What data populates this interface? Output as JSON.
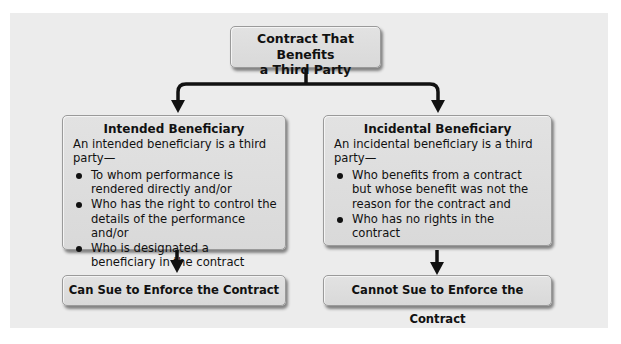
{
  "diagram": {
    "root": {
      "label_line1": "Contract That Benefits",
      "label_line2": "a Third Party"
    },
    "branches": [
      {
        "title": "Intended Beneficiary",
        "intro": "An intended beneficiary is a third party—",
        "bullets": [
          "To whom performance is rendered directly and/or",
          "Who has the right to control the details of the performance and/or",
          "Who is designated a beneficiary in the contract"
        ],
        "outcome": "Can Sue to Enforce the Contract"
      },
      {
        "title": "Incidental Beneficiary",
        "intro": "An incidental beneficiary is a third party—",
        "bullets": [
          "Who benefits from a contract but whose benefit was not the reason for the contract and",
          "Who has no rights in the contract"
        ],
        "outcome": "Cannot Sue to Enforce the Contract"
      }
    ],
    "colors": {
      "panel": "#ececec",
      "box": "#dcdcdc",
      "connector": "#111111"
    }
  }
}
